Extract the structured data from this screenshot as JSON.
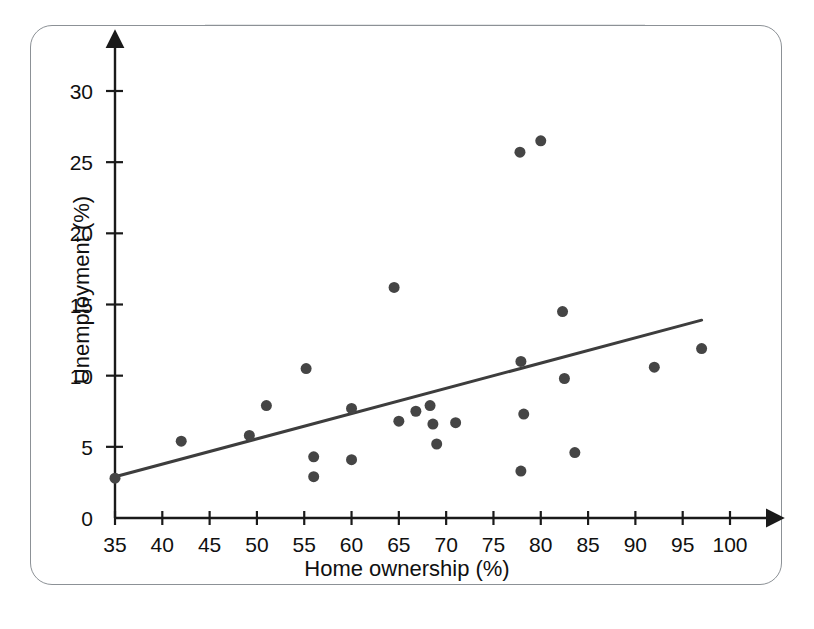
{
  "chart_data": {
    "type": "scatter",
    "title": "",
    "xlabel": "Home ownership (%)",
    "ylabel": "Unemployment (%)",
    "xlim": [
      35,
      102
    ],
    "ylim": [
      0,
      32
    ],
    "xticks": [
      35,
      40,
      45,
      50,
      55,
      60,
      65,
      70,
      75,
      80,
      85,
      90,
      95,
      100
    ],
    "yticks": [
      0,
      5,
      10,
      15,
      20,
      25,
      30
    ],
    "xtick_labels": [
      "35",
      "40",
      "45",
      "50",
      "55",
      "60",
      "65",
      "70",
      "75",
      "80",
      "85",
      "90",
      "95",
      "100"
    ],
    "ytick_labels": [
      "0",
      "5",
      "10",
      "15",
      "20",
      "25",
      "30"
    ],
    "grid": false,
    "legend": null,
    "marker_color": "#454545",
    "marker_size": 11,
    "axis_color": "#1a1a1a",
    "trendline_color": "#3d3d3d",
    "frame_color": "#8c9196",
    "points": [
      {
        "x": 35.0,
        "y": 2.8
      },
      {
        "x": 42.0,
        "y": 5.4
      },
      {
        "x": 49.2,
        "y": 5.8
      },
      {
        "x": 51.0,
        "y": 7.9
      },
      {
        "x": 55.2,
        "y": 10.5
      },
      {
        "x": 56.0,
        "y": 4.3
      },
      {
        "x": 56.0,
        "y": 2.9
      },
      {
        "x": 60.0,
        "y": 7.7
      },
      {
        "x": 60.0,
        "y": 4.1
      },
      {
        "x": 64.5,
        "y": 16.2
      },
      {
        "x": 65.0,
        "y": 6.8
      },
      {
        "x": 66.8,
        "y": 7.5
      },
      {
        "x": 68.3,
        "y": 7.9
      },
      {
        "x": 68.6,
        "y": 6.6
      },
      {
        "x": 69.0,
        "y": 5.2
      },
      {
        "x": 71.0,
        "y": 6.7
      },
      {
        "x": 77.8,
        "y": 25.7
      },
      {
        "x": 77.9,
        "y": 11.0
      },
      {
        "x": 78.2,
        "y": 7.3
      },
      {
        "x": 77.9,
        "y": 3.3
      },
      {
        "x": 80.0,
        "y": 26.5
      },
      {
        "x": 82.3,
        "y": 14.5
      },
      {
        "x": 82.5,
        "y": 9.8
      },
      {
        "x": 83.6,
        "y": 4.6
      },
      {
        "x": 92.0,
        "y": 10.6
      },
      {
        "x": 97.0,
        "y": 11.9
      }
    ],
    "trendline": {
      "x_start": 35.0,
      "y_start": 2.9,
      "x_end": 97.0,
      "y_end": 13.9
    }
  },
  "axes": {
    "x_arrow": true,
    "y_arrow": true
  }
}
